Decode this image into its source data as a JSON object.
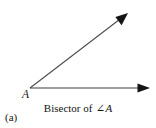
{
  "figure": {
    "width": 156,
    "height": 128,
    "background_color": "#ffffff",
    "stroke_color": "#3c3c3c",
    "text_color": "#111111",
    "part_label": "(a)",
    "vertex_label": "A",
    "caption": {
      "prefix": "Bisector of",
      "angle_symbol": "∠",
      "angle_name": "A",
      "full_text": "Bisector of ∠A"
    },
    "rays": [
      {
        "name": "horizontal-ray",
        "from": [
          30,
          88
        ],
        "to": [
          150,
          88
        ],
        "arrowhead": "filled-triangle",
        "label": ""
      },
      {
        "name": "diagonal-ray",
        "from": [
          30,
          88
        ],
        "to": [
          128,
          13
        ],
        "arrowhead": "filled-triangle",
        "label": ""
      }
    ],
    "vertex": {
      "name": "angle-vertex-A",
      "point": [
        30,
        88
      ]
    }
  }
}
